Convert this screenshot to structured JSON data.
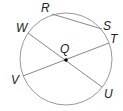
{
  "diagram": {
    "type": "circle-geometry",
    "center": {
      "label": "Q",
      "x": 66,
      "y": 59
    },
    "radius": 46,
    "points": [
      {
        "label": "R",
        "x": 52,
        "y": 14,
        "lx": 41,
        "ly": 12
      },
      {
        "label": "S",
        "x": 102,
        "y": 29,
        "lx": 103,
        "ly": 30
      },
      {
        "label": "T",
        "x": 109,
        "y": 43,
        "lx": 110,
        "ly": 43
      },
      {
        "label": "U",
        "x": 102,
        "y": 87,
        "lx": 104,
        "ly": 98
      },
      {
        "label": "V",
        "x": 23,
        "y": 76,
        "lx": 11,
        "ly": 84
      },
      {
        "label": "W",
        "x": 28,
        "y": 33,
        "lx": 16,
        "ly": 32
      }
    ],
    "segments": [
      {
        "name": "chord-RS",
        "from": "R",
        "to": "S"
      },
      {
        "name": "diameter-WU",
        "from": "W",
        "to": "U"
      },
      {
        "name": "diameter-VT",
        "from": "V",
        "to": "T"
      }
    ],
    "colors": {
      "stroke": "#888888",
      "point": "#000000",
      "text": "#222222"
    }
  }
}
